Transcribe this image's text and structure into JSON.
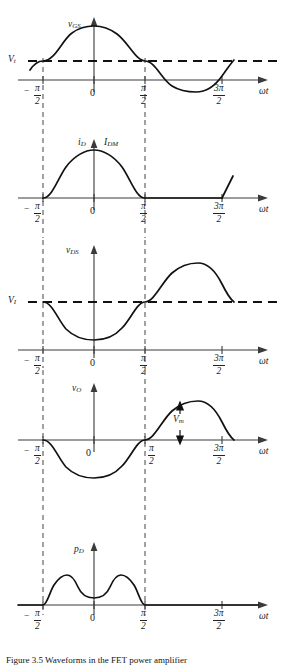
{
  "figure": {
    "kind": "waveform-timing-diagram",
    "caption": "Figure 3.5  Waveforms in the FET power amplifier",
    "axis_label_x": "ωt",
    "tick_labels": {
      "minus_half_pi": "−π/2",
      "zero": "0",
      "half_pi": "π/2",
      "three_half_pi": "3π/2"
    },
    "numerals": {
      "pi": "π",
      "two": "2",
      "three_pi": "3π",
      "minus": "−",
      "zero": "0"
    },
    "colors": {
      "curve": "#111111",
      "axis": "#3a3a3a",
      "dashed_level": "#111111",
      "dashed_vertical": "#555555",
      "background": "#ffffff"
    }
  },
  "panels": [
    {
      "id": "vgs",
      "y_label": "v",
      "y_sub": "GS",
      "level_label": "V",
      "level_sub": "t",
      "description": "Gate-source voltage: cosine starting at threshold Vt at -π/2, peak at 0, crossing Vt again at π/2",
      "has_level_dashed": true
    },
    {
      "id": "id",
      "y_label": "i",
      "y_sub": "D",
      "peak_label": "I",
      "peak_sub": "DM",
      "description": "Drain current: conduction half-cycle pulse from -π/2 to π/2 peaking at IDM, zero elsewhere, rising again at 3π/2",
      "has_level_dashed": false
    },
    {
      "id": "vds",
      "y_label": "v",
      "y_sub": "DS",
      "level_label": "V",
      "level_sub": "I",
      "description": "Drain-source voltage: minimum near 0, rising through VI at π/2, peak between π/2 and 3π/2, returns to VI",
      "has_level_dashed": true
    },
    {
      "id": "vo",
      "y_label": "v",
      "y_sub": "O",
      "amp_label": "V",
      "amp_sub": "m",
      "description": "Output voltage: negative half-cycle from -π/2 to π/2, positive half-cycle peaking at Vm",
      "has_level_dashed": false
    },
    {
      "id": "pd",
      "y_label": "p",
      "y_sub": "D",
      "description": "Drain dissipation: double-humped pulse between -π/2 and π/2, zero elsewhere",
      "has_level_dashed": false
    }
  ]
}
